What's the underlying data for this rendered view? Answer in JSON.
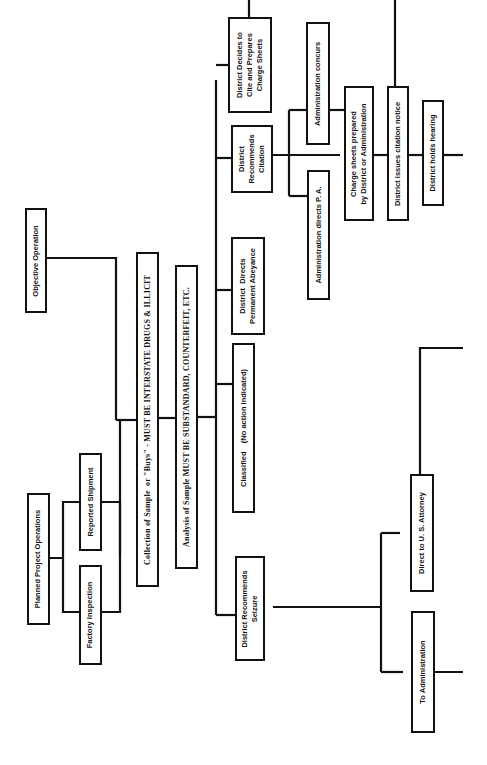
{
  "diagram": {
    "orientation": "rotated 90 degrees counter-clockwise",
    "nodes": {
      "objective_operation": "Objective Operation",
      "planned_project_operations": "Planned Project Operations",
      "factory_inspection": "Factory Inspection",
      "reported_shipment": "Reported Shipment",
      "collection_of_sample": "Collection of Sample  or \"Buys\" - MUST BE INTERSTATE DRUGS & ILLICIT",
      "analysis_of_sample": "Analysis of Sample MUST BE SUBSTANDARD, COUNTERFEIT, ETC.",
      "district_recommends_seizure": "District Recommends\nSeizure",
      "classified": "Classified    (No action indicated)",
      "district_directs_abeyance": "District  Directs\nPermanent Abeyance",
      "district_recommends_citation": "District\nRecommends\nCitation",
      "district_decides_to_cite": "District Decides to\nCite and Prepares\nCharge Sheets",
      "administration_directs_pa": "Administration directs P. A.",
      "administration_concurs": "Administration concurs",
      "charge_sheets_prepared": "Charge sheets prepared\nby District or Administration",
      "district_issues_citation": "District issues citation notice",
      "district_holds_hearing": "District holds hearing",
      "to_administration": "To Administration",
      "direct_to_us_attorney": "Direct to U. S. Attorney"
    },
    "line_color": "#111111",
    "background": "#ffffff"
  }
}
